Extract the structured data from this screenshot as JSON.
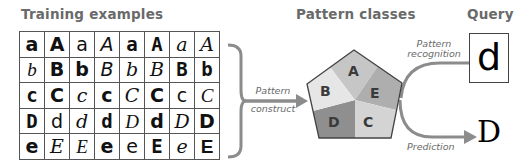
{
  "headings": {
    "training": "Training examples",
    "classes": "Pattern classes",
    "query": "Query"
  },
  "grid": {
    "rows": [
      [
        {
          "char": "a",
          "style": "f-sansb"
        },
        {
          "char": "A",
          "style": "f-sansb"
        },
        {
          "char": "a",
          "style": "f-sans"
        },
        {
          "char": "A",
          "style": "f-sansi"
        },
        {
          "char": "a",
          "style": "f-mono"
        },
        {
          "char": "A",
          "style": "f-mono"
        },
        {
          "char": "a",
          "style": "f-serifi"
        },
        {
          "char": "A",
          "style": "f-serifi"
        }
      ],
      [
        {
          "char": "b",
          "style": "f-hand"
        },
        {
          "char": "B",
          "style": "f-sansb"
        },
        {
          "char": "b",
          "style": "f-sansb"
        },
        {
          "char": "B",
          "style": "f-sansi"
        },
        {
          "char": "b",
          "style": "f-serifi"
        },
        {
          "char": "B",
          "style": "f-serifi"
        },
        {
          "char": "B",
          "style": "f-mono"
        },
        {
          "char": "b",
          "style": "f-mono"
        }
      ],
      [
        {
          "char": "c",
          "style": "f-mono"
        },
        {
          "char": "C",
          "style": "f-sansb"
        },
        {
          "char": "c",
          "style": "f-serifi"
        },
        {
          "char": "c",
          "style": "f-sansb"
        },
        {
          "char": "C",
          "style": "f-serifi"
        },
        {
          "char": "C",
          "style": "f-sansb"
        },
        {
          "char": "c",
          "style": "f-sans"
        },
        {
          "char": "C",
          "style": "f-hand"
        }
      ],
      [
        {
          "char": "D",
          "style": "f-mono"
        },
        {
          "char": "d",
          "style": "f-sans"
        },
        {
          "char": "d",
          "style": "f-serifi"
        },
        {
          "char": "d",
          "style": "f-mono"
        },
        {
          "char": "D",
          "style": "f-hand"
        },
        {
          "char": "d",
          "style": "f-sansb"
        },
        {
          "char": "D",
          "style": "f-serifi"
        },
        {
          "char": "D",
          "style": "f-sansb"
        }
      ],
      [
        {
          "char": "e",
          "style": "f-sansb"
        },
        {
          "char": "E",
          "style": "f-serifi"
        },
        {
          "char": "E",
          "style": "f-hand"
        },
        {
          "char": "e",
          "style": "f-sansb"
        },
        {
          "char": "e",
          "style": "f-sans"
        },
        {
          "char": "E",
          "style": "f-mono"
        },
        {
          "char": "e",
          "style": "f-serifi"
        },
        {
          "char": "E",
          "style": "f-lsans"
        }
      ]
    ]
  },
  "arrows": {
    "construct_line1": "Pattern",
    "construct_line2": "construct",
    "recognition_line1": "Pattern",
    "recognition_line2": "recognition",
    "prediction": "Prediction"
  },
  "pentagon": {
    "slices": [
      {
        "label": "A",
        "color": "#c6c6c6"
      },
      {
        "label": "E",
        "color": "#aeaeae"
      },
      {
        "label": "C",
        "color": "#d4d4d4"
      },
      {
        "label": "D",
        "color": "#8f8f8f"
      },
      {
        "label": "B",
        "color": "#e6e6e6"
      }
    ]
  },
  "query": {
    "glyph": "d"
  },
  "prediction": {
    "glyph": "D"
  },
  "colors": {
    "heading": "#6a6a6a",
    "arrow": "#8c8c8c",
    "outline": "#444444"
  }
}
